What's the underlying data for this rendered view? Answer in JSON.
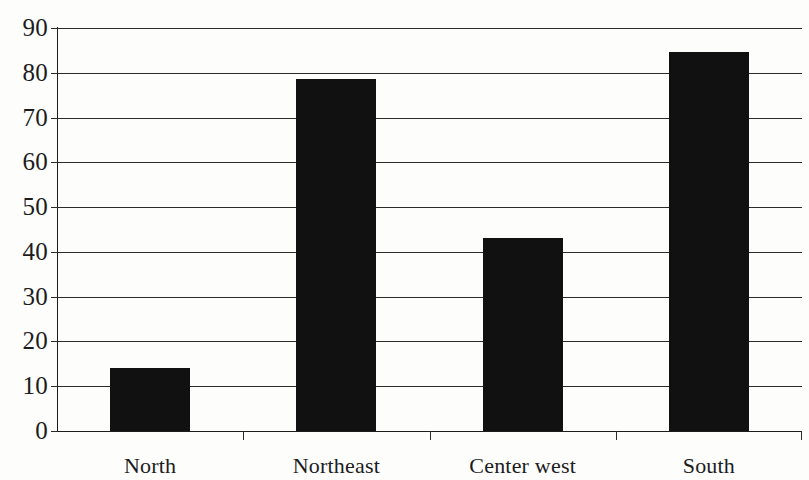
{
  "chart_data": {
    "type": "bar",
    "title": "",
    "subtitle": "",
    "xlabel": "",
    "ylabel": "",
    "categories": [
      "North",
      "Northeast",
      "Center west",
      "South"
    ],
    "values": [
      14,
      78.7,
      43,
      84.7
    ],
    "series": [
      {
        "name": "",
        "values": [
          14,
          78.7,
          43,
          84.7
        ]
      }
    ],
    "ylim": [
      0,
      90
    ],
    "ytick_step": 10,
    "ytick_labels": [
      "0",
      "10",
      "20",
      "30",
      "40",
      "50",
      "60",
      "70",
      "80",
      "90"
    ],
    "ytick_values": [
      0,
      10,
      20,
      30,
      40,
      50,
      60,
      70,
      80,
      90
    ],
    "grid": "horizontal",
    "legend": "none",
    "bar_color": "#111111",
    "axis_color": "#1d1d1d",
    "background_color": "#fdfdfc",
    "annotations": []
  }
}
